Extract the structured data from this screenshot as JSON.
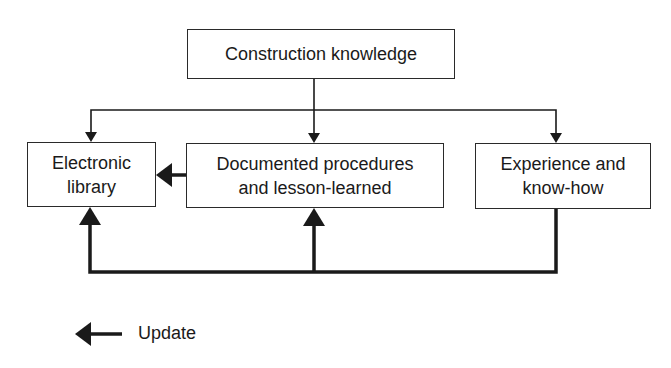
{
  "diagram": {
    "nodes": {
      "top": {
        "label": "Construction knowledge"
      },
      "electronic": {
        "line1": "Electronic",
        "line2": "library"
      },
      "documented": {
        "line1": "Documented procedures",
        "line2": "and lesson-learned"
      },
      "experience": {
        "line1": "Experience and",
        "line2": "know-how"
      }
    },
    "edges": [
      {
        "from": "Construction knowledge",
        "to": "Electronic library",
        "style": "thin"
      },
      {
        "from": "Construction knowledge",
        "to": "Documented procedures and lesson-learned",
        "style": "thin"
      },
      {
        "from": "Construction knowledge",
        "to": "Experience and know-how",
        "style": "thin"
      },
      {
        "from": "Documented procedures and lesson-learned",
        "to": "Electronic library",
        "style": "update"
      },
      {
        "from": "Experience and know-how",
        "to": "Electronic library",
        "style": "update"
      },
      {
        "from": "Experience and know-how",
        "to": "Documented procedures and lesson-learned",
        "style": "update"
      }
    ],
    "legend": {
      "label": "Update",
      "icon": "thick-left-arrow-icon"
    },
    "colors": {
      "line": "#1a1a1a",
      "background": "#ffffff"
    }
  }
}
